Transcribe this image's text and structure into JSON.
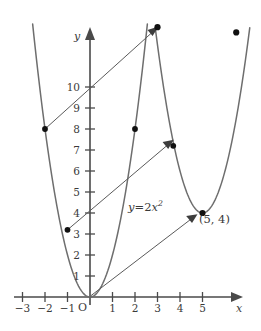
{
  "figure": {
    "kind": "cartesian-plot",
    "width": 261,
    "height": 331,
    "background": "#ffffff",
    "curve_color": "#6e6e6e",
    "axis_color": "#4a4a4a",
    "dot_color": "#111111"
  },
  "axes": {
    "x_axis_label": "x",
    "y_axis_label": "y",
    "origin_label": "O",
    "x_ticks": [
      {
        "label": "−3",
        "value": -3
      },
      {
        "label": "−2",
        "value": -2
      },
      {
        "label": "−1",
        "value": -1
      },
      {
        "label": "1",
        "value": 1
      },
      {
        "label": "2",
        "value": 2
      },
      {
        "label": "3",
        "value": 3
      },
      {
        "label": "4",
        "value": 4
      },
      {
        "label": "5",
        "value": 5
      }
    ],
    "y_ticks": [
      {
        "label": "1",
        "value": 1
      },
      {
        "label": "2",
        "value": 2
      },
      {
        "label": "3",
        "value": 3
      },
      {
        "label": "4",
        "value": 4
      },
      {
        "label": "5",
        "value": 5
      },
      {
        "label": "6",
        "value": 6
      },
      {
        "label": "7",
        "value": 7
      },
      {
        "label": "8",
        "value": 8
      },
      {
        "label": "9",
        "value": 9
      },
      {
        "label": "10",
        "value": 10
      }
    ],
    "x_range": [
      -3.5,
      6.0
    ],
    "y_range": [
      -0.6,
      13.2
    ]
  },
  "annotations": {
    "equation_y": "y",
    "equation_eq": "=",
    "equation_coeff": "2",
    "equation_var": "x",
    "equation_exp": "2",
    "equation_full": "y = 2x²",
    "point_label": "(5, 4)"
  },
  "chart_data": {
    "type": "line",
    "title": "",
    "xlabel": "x",
    "ylabel": "y",
    "xlim": [
      -3.5,
      6.0
    ],
    "ylim": [
      -0.6,
      13.2
    ],
    "grid": false,
    "legend": "none",
    "series": [
      {
        "name": "y = 2x^2",
        "kind": "parabola",
        "equation": "y = 2x^2",
        "vertex": [
          0,
          0
        ],
        "a": 2,
        "x_plot_range": [
          -2.55,
          2.55
        ]
      },
      {
        "name": "translated parabola",
        "kind": "parabola",
        "equation": "y = 2(x - 5)^2 + 4",
        "vertex": [
          5,
          4
        ],
        "a": 2,
        "x_plot_range": [
          2.9,
          7.1
        ]
      }
    ],
    "points": [
      {
        "label": "",
        "x": -2,
        "y": 8
      },
      {
        "label": "",
        "x": -1,
        "y": 3.2
      },
      {
        "label": "",
        "x": 2,
        "y": 8
      },
      {
        "label": "",
        "x": 3,
        "y": 12.85
      },
      {
        "label": "",
        "x": 3.7,
        "y": 7.2
      },
      {
        "label": "(5, 4)",
        "x": 5,
        "y": 4
      },
      {
        "label": "",
        "x": 6.5,
        "y": 12.6
      }
    ],
    "vectors": [
      {
        "name": "translation-vector-top",
        "from": [
          -2,
          8
        ],
        "to": [
          2.95,
          12.8
        ]
      },
      {
        "name": "translation-vector-middle",
        "from": [
          -1,
          3.2
        ],
        "to": [
          3.62,
          7.15
        ]
      },
      {
        "name": "translation-vector-bottom",
        "from": [
          0,
          0
        ],
        "to": [
          4.9,
          4.05
        ]
      }
    ]
  }
}
